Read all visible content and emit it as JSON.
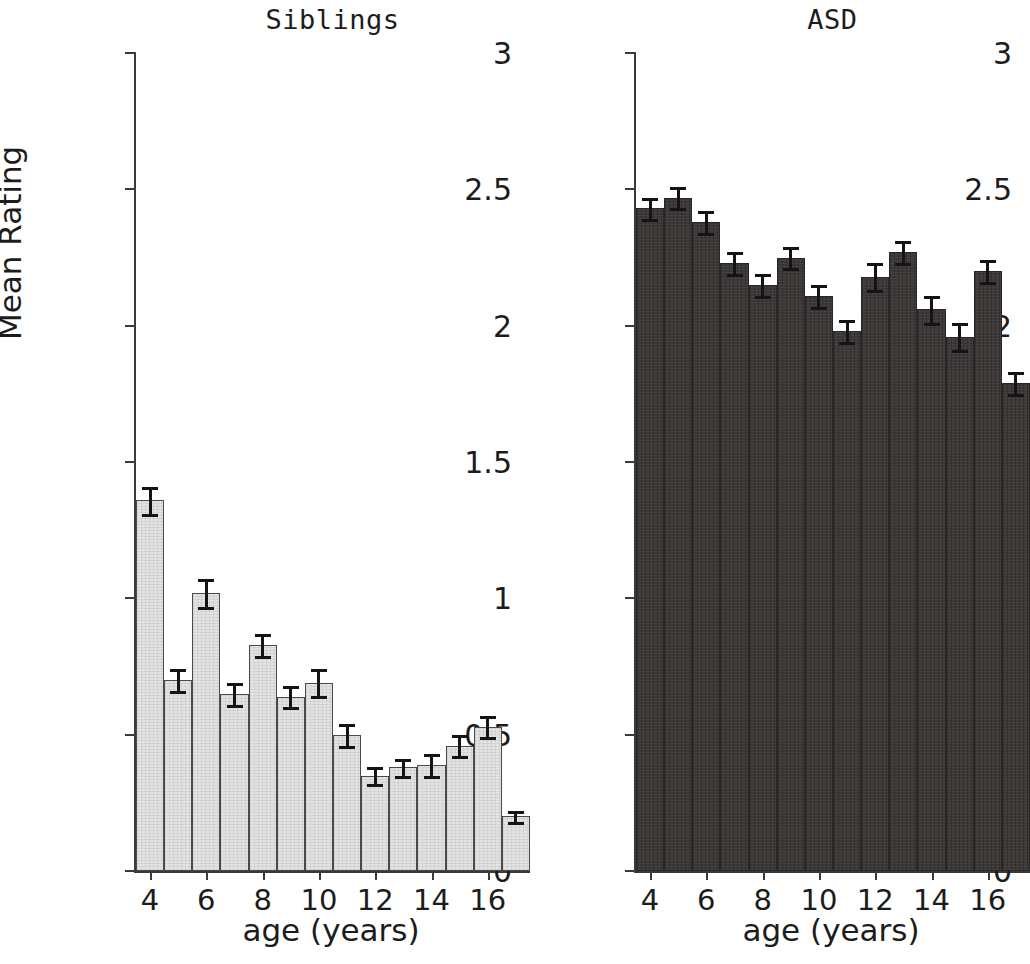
{
  "figure": {
    "background": "#ffffff",
    "axis_color": "#3a3a3a",
    "error_bar_color": "#141414"
  },
  "chart_data": {
    "type": "bar",
    "title": "",
    "panels": [
      {
        "title": "Siblings",
        "xlabel": "age (years)",
        "ylabel": "Mean Rating",
        "ylim": [
          0,
          3
        ],
        "yticks": [
          "0",
          "0.5",
          "1",
          "1.5",
          "2",
          "2.5",
          "3"
        ],
        "ytick_values": [
          0,
          0.5,
          1,
          1.5,
          2,
          2.5,
          3
        ],
        "xlim": [
          3.5,
          17.5
        ],
        "xticks": [
          "4",
          "6",
          "8",
          "10",
          "12",
          "14",
          "16"
        ],
        "xtick_values": [
          4,
          6,
          8,
          10,
          12,
          14,
          16
        ],
        "grid": false,
        "bar_color": "#e3e3e3",
        "categories": [
          4,
          5,
          6,
          7,
          8,
          9,
          10,
          11,
          12,
          13,
          14,
          15,
          16,
          17
        ],
        "values": [
          1.36,
          0.7,
          1.02,
          0.65,
          0.83,
          0.64,
          0.69,
          0.5,
          0.35,
          0.38,
          0.39,
          0.46,
          0.53,
          0.2
        ],
        "errors": [
          0.05,
          0.04,
          0.05,
          0.04,
          0.04,
          0.04,
          0.05,
          0.04,
          0.03,
          0.03,
          0.04,
          0.04,
          0.04,
          0.02
        ]
      },
      {
        "title": "ASD",
        "xlabel": "age (years)",
        "ylabel": "",
        "ylim": [
          0,
          3
        ],
        "yticks": [
          "0",
          "0.5",
          "1",
          "1.5",
          "2",
          "2.5",
          "3"
        ],
        "ytick_values": [
          0,
          0.5,
          1,
          1.5,
          2,
          2.5,
          3
        ],
        "xlim": [
          3.5,
          17.5
        ],
        "xticks": [
          "4",
          "6",
          "8",
          "10",
          "12",
          "14",
          "16"
        ],
        "xtick_values": [
          4,
          6,
          8,
          10,
          12,
          14,
          16
        ],
        "grid": false,
        "bar_color": "#3d3838",
        "categories": [
          4,
          5,
          6,
          7,
          8,
          9,
          10,
          11,
          12,
          13,
          14,
          15,
          16,
          17
        ],
        "values": [
          2.43,
          2.47,
          2.38,
          2.23,
          2.15,
          2.25,
          2.11,
          1.98,
          2.18,
          2.27,
          2.06,
          1.96,
          2.2,
          1.79
        ],
        "errors": [
          0.04,
          0.04,
          0.04,
          0.04,
          0.04,
          0.04,
          0.04,
          0.04,
          0.05,
          0.04,
          0.05,
          0.05,
          0.04,
          0.04
        ]
      }
    ]
  }
}
